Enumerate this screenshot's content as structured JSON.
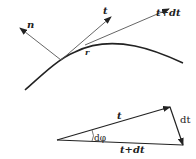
{
  "diagram": {
    "top": {
      "normal_label": "n",
      "tangent_label": "t",
      "tangent_next_label": "t+dt",
      "point_label": "r"
    },
    "triangle": {
      "side_t_label": "t",
      "side_dt_label": "dt",
      "side_tdt_label": "t+dt",
      "angle_label": "dφ"
    },
    "colors": {
      "curve": "#222222",
      "arrows": "#555555"
    }
  }
}
